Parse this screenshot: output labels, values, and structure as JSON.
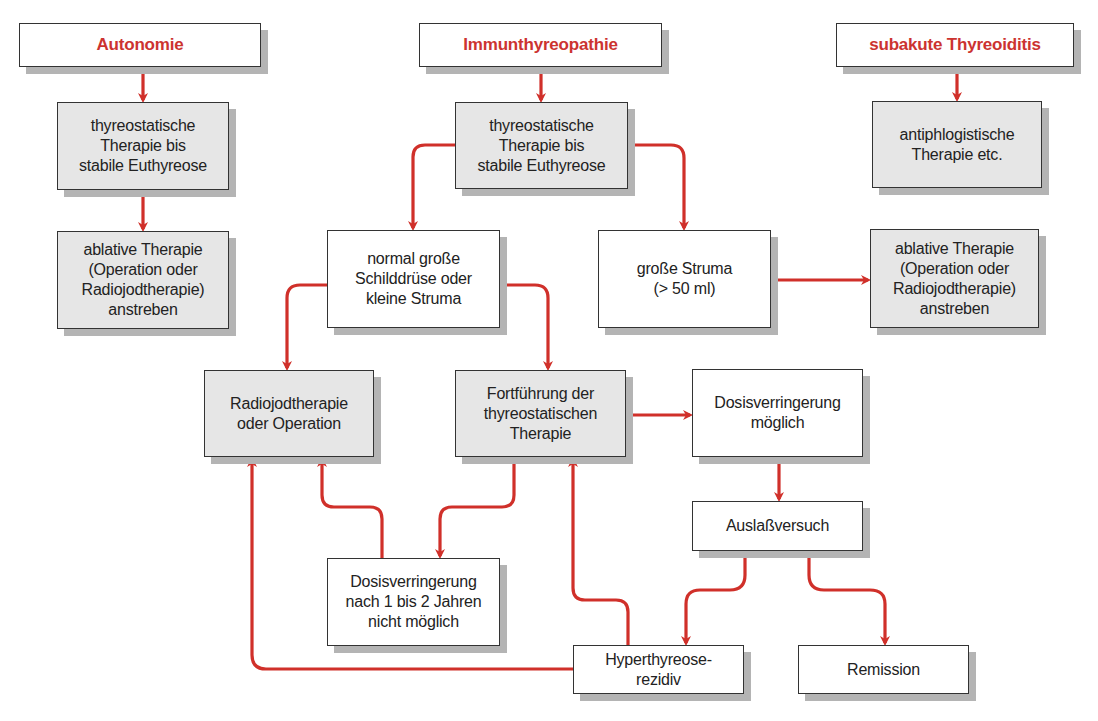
{
  "colors": {
    "accent_red": "#d0302a",
    "box_gray": "#e6e6e6",
    "shadow": "#b4b4b4"
  },
  "headers": {
    "autonomie": "Autonomie",
    "immun": "Immunthyreopathie",
    "subakut": "subakute Thyreoiditis"
  },
  "nodes": {
    "thyreo_left": "thyreostatische\nTherapie bis\nstabile Euthyreose",
    "thyreo_mid": "thyreostatische\nTherapie bis\nstabile Euthyreose",
    "antiphlog": "antiphlogistische\nTherapie etc.",
    "ablativ_left": "ablative Therapie\n(Operation oder\nRadiojodtherapie)\nanstreben",
    "normal": "normal große\nSchilddrüse oder\nkleine Struma",
    "grosse_struma": "große Struma\n(> 50 ml)",
    "ablativ_right": "ablative Therapie\n(Operation oder\nRadiojodtherapie)\nanstreben",
    "radiojod": "Radiojodtherapie\noder Operation",
    "fortfuehrung": "Fortführung der\nthyreostatischen\nTherapie",
    "dosis_moeglich": "Dosisverringerung\nmöglich",
    "auslass": "Auslaßversuch",
    "dosis_nicht": "Dosisverringerung\nnach 1 bis 2 Jahren\nnicht möglich",
    "rezidiv": "Hyperthyreose-\nrezidiv",
    "remission": "Remission"
  }
}
